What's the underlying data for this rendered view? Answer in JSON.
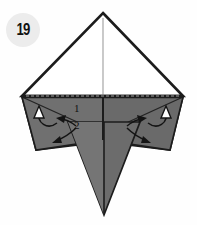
{
  "diagram": {
    "type": "origami-instruction-step",
    "step_badge": "19",
    "fold_labels": [
      {
        "text": "1",
        "x": 74,
        "y": 103
      },
      {
        "text": "2",
        "x": 75,
        "y": 120
      }
    ],
    "colors": {
      "paper_front": "#6f6f6f",
      "paper_front_dark": "#5c5c5c",
      "paper_front_light": "#7c7c7c",
      "paper_back": "#ffffff",
      "outline": "#1c1c1c",
      "crease": "#9a9a9a",
      "badge_bg": "#ececec",
      "badge_text": "#111111",
      "background": "#ffffff"
    },
    "shapes": {
      "top_triangle": "103,12 22,96 183,96",
      "center_crease": "103,16 103,96",
      "base_edge": "22,96 183,96",
      "left_wing": "22,96 103,96 103,140 36,149",
      "right_wing": "183,96 103,96 103,140 170,149",
      "left_spike": "22,96 78,146 36,149",
      "right_spike": "183,96 128,146 170,149",
      "bottom_spike": "68,123 104,215 140,123"
    },
    "arrows": [
      {
        "name": "unfold-arrow-left",
        "style": "curved-hollow-head",
        "direction": "up"
      },
      {
        "name": "unfold-arrow-right",
        "style": "curved-hollow-head",
        "direction": "up"
      },
      {
        "name": "fold-arrow-left",
        "style": "curved-solid-head",
        "direction": "left"
      },
      {
        "name": "fold-arrow-right",
        "style": "curved-solid-head",
        "direction": "right"
      },
      {
        "name": "fold-arrow-left-lower",
        "style": "curved-solid-head",
        "direction": "down-left"
      },
      {
        "name": "fold-arrow-right-lower",
        "style": "curved-solid-head",
        "direction": "down-right"
      }
    ]
  }
}
